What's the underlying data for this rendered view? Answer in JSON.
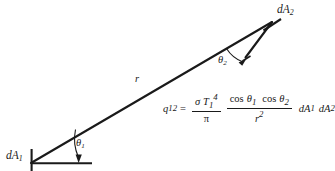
{
  "figure": {
    "kind": "radiation-heat-exchange-between-differential-areas",
    "background_color": "#ffffff",
    "ink_color": "#1a1a1a"
  },
  "labels": {
    "area_1": {
      "base": "dA",
      "sub": "1"
    },
    "area_2": {
      "base": "dA",
      "sub": "2"
    },
    "angle_1": {
      "base": "θ",
      "sub": "1"
    },
    "angle_2": {
      "base": "θ",
      "sub": "2"
    },
    "distance": {
      "base": "r"
    }
  },
  "equation": {
    "lhs": {
      "base": "q",
      "sub": "12"
    },
    "relation": "=",
    "fraction_1": {
      "numerator_sigma": "σ",
      "numerator_T": "T",
      "numerator_T_sub": "1",
      "numerator_T_sup": "4",
      "denominator": "π"
    },
    "fraction_2": {
      "numerator": "cos θ₁ cos θ₂",
      "numerator_cos": "cos",
      "numerator_theta_a": "θ",
      "numerator_theta_a_sub": "1",
      "numerator_theta_b": "θ",
      "numerator_theta_b_sub": "2",
      "denominator_base": "r",
      "denominator_sup": "2"
    },
    "tail_1": {
      "base": "dA",
      "sub": "1"
    },
    "tail_2": {
      "base": "dA",
      "sub": "2"
    }
  },
  "geometry": {
    "ray_start": [
      31,
      163
    ],
    "ray_end": [
      272,
      22
    ],
    "baseline_start": [
      31,
      163
    ],
    "baseline_end": [
      92,
      163
    ],
    "tick_1_top": [
      31,
      150
    ],
    "tick_1_bottom": [
      31,
      171
    ],
    "secondary_line_start": [
      245,
      57
    ],
    "secondary_line_end": [
      272,
      22
    ],
    "tick_2_start": [
      265,
      29
    ],
    "tick_2_end": [
      281,
      20
    ]
  }
}
